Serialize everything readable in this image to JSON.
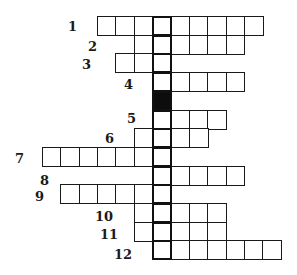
{
  "crossword": {
    "grid": {
      "origin_x": 42,
      "origin_y": 16,
      "cell_w": 18.35,
      "cell_h": 18.7,
      "key_col": 6,
      "colors": {
        "line": "#1a1a1a",
        "key_line": "#111111",
        "black": "#0d0d0d",
        "bg": "#ffffff"
      }
    },
    "rows": [
      {
        "number": "1",
        "start_col": 3,
        "length": 9,
        "label_x": 68,
        "label_y": 20
      },
      {
        "number": "2",
        "start_col": 5,
        "length": 6,
        "label_x": 88,
        "label_y": 40
      },
      {
        "number": "3",
        "start_col": 4,
        "length": 3,
        "label_x": 82,
        "label_y": 58
      },
      {
        "number": "4",
        "start_col": 6,
        "length": 5,
        "label_x": 124,
        "label_y": 78
      },
      {
        "number": "",
        "start_col": 6,
        "length": 1,
        "black": true
      },
      {
        "number": "5",
        "start_col": 6,
        "length": 4,
        "label_x": 127,
        "label_y": 112
      },
      {
        "number": "6",
        "start_col": 5,
        "length": 4,
        "label_x": 105,
        "label_y": 132
      },
      {
        "number": "7",
        "start_col": 0,
        "length": 7,
        "label_x": 15,
        "label_y": 152
      },
      {
        "number": "8",
        "start_col": 6,
        "length": 5,
        "label_x": 40,
        "label_y": 174
      },
      {
        "number": "9",
        "start_col": 1,
        "length": 6,
        "label_x": 35,
        "label_y": 190
      },
      {
        "number": "10",
        "start_col": 5,
        "length": 5,
        "label_x": 95,
        "label_y": 210
      },
      {
        "number": "11",
        "start_col": 5,
        "length": 5,
        "label_x": 100,
        "label_y": 228
      },
      {
        "number": "12",
        "start_col": 6,
        "length": 7,
        "label_x": 114,
        "label_y": 248
      }
    ]
  }
}
